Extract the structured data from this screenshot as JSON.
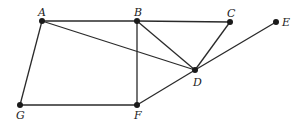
{
  "graph": {
    "nodes": [
      {
        "id": "A",
        "label": "A",
        "x": 42,
        "y": 21,
        "lx": 38,
        "ly": 7
      },
      {
        "id": "B",
        "label": "B",
        "x": 137,
        "y": 21,
        "lx": 134,
        "ly": 7
      },
      {
        "id": "C",
        "label": "C",
        "x": 230,
        "y": 22,
        "lx": 227,
        "ly": 8
      },
      {
        "id": "E",
        "label": "E",
        "x": 276,
        "y": 22,
        "lx": 282,
        "ly": 17
      },
      {
        "id": "D",
        "label": "D",
        "x": 195,
        "y": 70,
        "lx": 193,
        "ly": 77
      },
      {
        "id": "G",
        "label": "G",
        "x": 20,
        "y": 105,
        "lx": 16,
        "ly": 110
      },
      {
        "id": "F",
        "label": "F",
        "x": 137,
        "y": 105,
        "lx": 134,
        "ly": 110
      }
    ],
    "edges": [
      [
        "A",
        "B"
      ],
      [
        "B",
        "C"
      ],
      [
        "A",
        "G"
      ],
      [
        "G",
        "F"
      ],
      [
        "B",
        "F"
      ],
      [
        "A",
        "D"
      ],
      [
        "B",
        "D"
      ],
      [
        "C",
        "D"
      ],
      [
        "D",
        "E"
      ],
      [
        "F",
        "D"
      ]
    ]
  }
}
